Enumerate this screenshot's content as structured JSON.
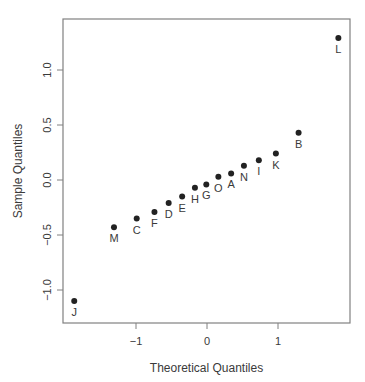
{
  "chart_data": {
    "type": "scatter",
    "subtype": "normal-qq-plot",
    "title": "",
    "xlabel": "Theoretical Quantiles",
    "ylabel": "Sample Quantiles",
    "xlim": [
      -1.88,
      2.0
    ],
    "ylim": [
      -1.3,
      1.4
    ],
    "xticks": [
      -1,
      0,
      1
    ],
    "xtick_labels": [
      "−1",
      "0",
      "1"
    ],
    "yticks": [
      -1.0,
      -0.5,
      0.0,
      0.5,
      1.0
    ],
    "ytick_labels": [
      "−1.0",
      "−0.5",
      "0.0",
      "0.5",
      "1.0"
    ],
    "grid": false,
    "legend": null,
    "point_color": "#222222",
    "points": [
      {
        "label": "J",
        "x": -1.87,
        "y": -1.1
      },
      {
        "label": "M",
        "x": -1.31,
        "y": -0.43
      },
      {
        "label": "C",
        "x": -0.99,
        "y": -0.35
      },
      {
        "label": "F",
        "x": -0.74,
        "y": -0.29
      },
      {
        "label": "D",
        "x": -0.54,
        "y": -0.21
      },
      {
        "label": "E",
        "x": -0.35,
        "y": -0.15
      },
      {
        "label": "H",
        "x": -0.17,
        "y": -0.07
      },
      {
        "label": "G",
        "x": -0.01,
        "y": -0.04
      },
      {
        "label": "O",
        "x": 0.16,
        "y": 0.03
      },
      {
        "label": "A",
        "x": 0.34,
        "y": 0.06
      },
      {
        "label": "N",
        "x": 0.52,
        "y": 0.13
      },
      {
        "label": "I",
        "x": 0.73,
        "y": 0.18
      },
      {
        "label": "K",
        "x": 0.97,
        "y": 0.24
      },
      {
        "label": "B",
        "x": 1.29,
        "y": 0.43
      },
      {
        "label": "L",
        "x": 1.85,
        "y": 1.29
      }
    ]
  },
  "layout": {
    "plot_box": {
      "left": 63,
      "top": 19,
      "right": 350,
      "bottom": 323
    },
    "x_zero_px": 207,
    "x_px_per_unit": 71,
    "y_zero_px": 180,
    "y_px_per_unit": 110
  }
}
